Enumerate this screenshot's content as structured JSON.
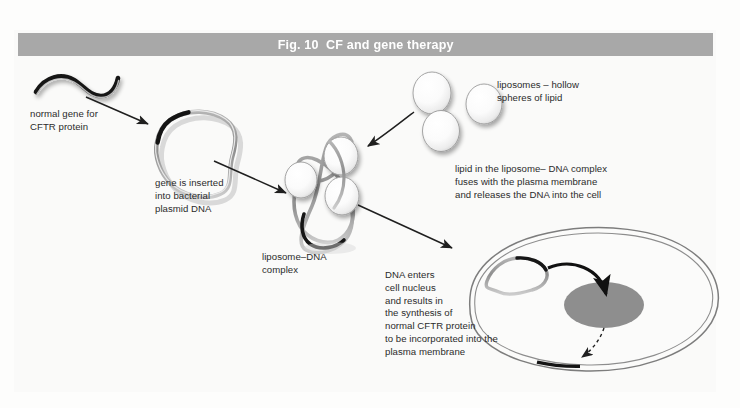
{
  "figure": {
    "title": "Fig. 10  CF and gene therapy",
    "title_bar_color": "#a8a8a8",
    "title_text_color": "#ffffff",
    "background_color": "#fdfdfc"
  },
  "labels": {
    "normal_gene": "normal gene for\nCFTR protein",
    "plasmid_insert": "gene is inserted\ninto bacterial\nplasmid DNA",
    "liposome_dna_complex": "liposome–DNA\ncomplex",
    "liposomes": "liposomes – hollow\nspheres of lipid",
    "fusion": "lipid in the liposome– DNA complex\nfuses with the plasma membrane\nand releases the DNA into the cell",
    "nucleus_entry": "DNA enters\ncell nucleus\nand results in\nthe synthesis of\nnormal CFTR protein\nto be incorporated into the\nplasma membrane"
  },
  "colors": {
    "gene_dark": "#141414",
    "dna_strand": "#8c8c8c",
    "dna_strand_light": "#c9c9c9",
    "liposome_fill": "#ffffff",
    "liposome_stroke": "#9a9a9a",
    "nucleus_fill": "#8e8e8e",
    "membrane_stroke": "#7d7d7d",
    "arrow_color": "#1f1f1f",
    "text_color": "#2b2b2b"
  },
  "elements": {
    "gene_squiggle": "normal-CFTR-gene-strand",
    "plasmid_ring": "bacterial-plasmid-dna-ring",
    "complex": "liposome-dna-complex",
    "free_liposomes_count": 3,
    "target_cell": "target-cell-with-plasma-membrane",
    "nucleus": "cell-nucleus",
    "cftr_protein_band": "cftr-protein-in-membrane"
  }
}
